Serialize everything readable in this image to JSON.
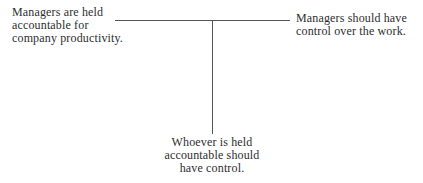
{
  "diagram": {
    "type": "argument-map",
    "premises": [
      {
        "id": "premise-left",
        "lines": [
          "Managers are held",
          "accountable for",
          "company productivity."
        ]
      },
      {
        "id": "premise-right",
        "lines": [
          "Managers should have",
          "control over the work."
        ]
      }
    ],
    "conclusion": {
      "lines": [
        "Whoever is held",
        "accountable should",
        "have control."
      ]
    },
    "colors": {
      "text": "#2e2e2e",
      "line": "#555555",
      "background": "#ffffff"
    }
  }
}
